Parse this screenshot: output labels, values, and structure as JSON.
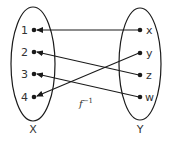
{
  "diagram": {
    "function_label": "f",
    "function_superscript": "−1",
    "domain_set": {
      "label": "X",
      "elements": [
        {
          "label": "1",
          "x": 34,
          "y": 30
        },
        {
          "label": "2",
          "x": 34,
          "y": 52
        },
        {
          "label": "3",
          "x": 34,
          "y": 74
        },
        {
          "label": "4",
          "x": 34,
          "y": 97
        }
      ]
    },
    "codomain_set": {
      "label": "Y",
      "elements": [
        {
          "label": "x",
          "x": 140,
          "y": 30
        },
        {
          "label": "y",
          "x": 140,
          "y": 53
        },
        {
          "label": "z",
          "x": 140,
          "y": 75
        },
        {
          "label": "w",
          "x": 140,
          "y": 97
        }
      ]
    },
    "mappings": [
      {
        "from": "x",
        "to": "1"
      },
      {
        "from": "y",
        "to": "4"
      },
      {
        "from": "z",
        "to": "2"
      },
      {
        "from": "w",
        "to": "3"
      }
    ],
    "colors": {
      "stroke": "#1a1a1a",
      "text": "#333333",
      "background": "#ffffff"
    }
  }
}
